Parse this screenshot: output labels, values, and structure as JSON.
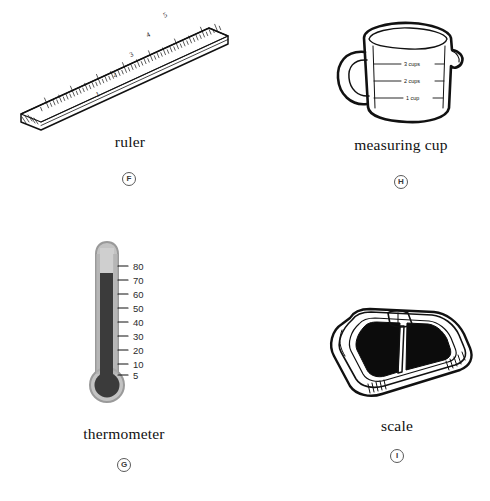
{
  "page": {
    "kind": "measurement-tools-picture-worksheet",
    "background_color": "#ffffff",
    "ink_color": "#111111"
  },
  "items": [
    {
      "id": "ruler",
      "caption": "ruler",
      "letter": "F",
      "icon_name": "ruler-illustration",
      "tick_numbers": [
        "1",
        "2",
        "3",
        "4",
        "5",
        "6",
        "7"
      ],
      "colors": {
        "outline": "#111111",
        "fill": "#ffffff"
      }
    },
    {
      "id": "measuring-cup",
      "caption": "measuring cup",
      "letter": "H",
      "icon_name": "measuring-cup-illustration",
      "graduation_labels": [
        "3 cups",
        "2 cups",
        "1 cup"
      ],
      "colors": {
        "outline": "#111111",
        "fill": "#ffffff"
      }
    },
    {
      "id": "thermometer",
      "caption": "thermometer",
      "letter": "G",
      "icon_name": "thermometer-illustration",
      "scale_numbers": [
        "80",
        "70",
        "60",
        "50",
        "40",
        "30",
        "20",
        "10",
        "5"
      ],
      "reading": "75",
      "colors": {
        "tube": "#b9b9b9",
        "tube_edge": "#8f8f8f",
        "mercury": "#3b3b3b"
      }
    },
    {
      "id": "scale",
      "caption": "scale",
      "letter": "I",
      "icon_name": "bathroom-scale-illustration",
      "colors": {
        "outline": "#111111",
        "platform": "#0c0c0c",
        "body": "#ffffff"
      }
    }
  ]
}
